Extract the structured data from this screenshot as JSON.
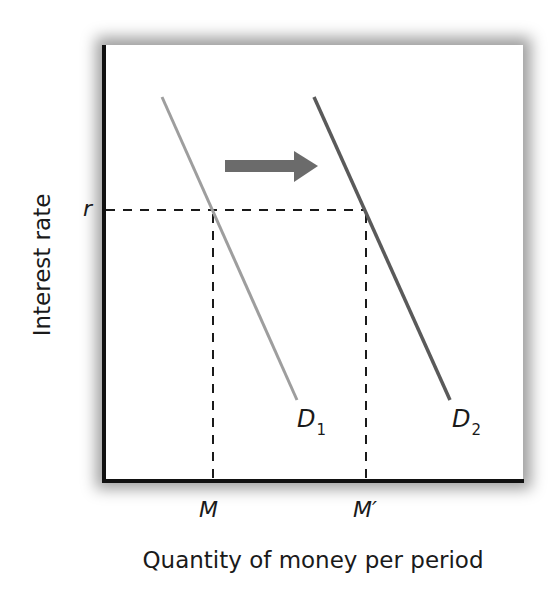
{
  "chart_data": {
    "type": "line",
    "title": "",
    "xlabel": "Quantity of money per period",
    "ylabel": "Interest rate",
    "grid": false,
    "legend": "none",
    "series": [
      {
        "name": "D1",
        "label_main": "D",
        "label_sub": "1",
        "color": "#9e9e9e",
        "points": [
          [
            162,
            97
          ],
          [
            297,
            400
          ]
        ]
      },
      {
        "name": "D2",
        "label_main": "D",
        "label_sub": "2",
        "color": "#5a5a5a",
        "points": [
          [
            314,
            97
          ],
          [
            450,
            400
          ]
        ]
      }
    ],
    "reference_lines": {
      "horizontal": {
        "label": "r",
        "y": 210,
        "x_from": 104,
        "x_to": 366
      },
      "vertical": [
        {
          "label": "M",
          "x": 213,
          "y_from": 210,
          "y_to": 481
        },
        {
          "label": "M′",
          "x": 366,
          "y_from": 210,
          "y_to": 481
        }
      ]
    },
    "annotations": [
      {
        "type": "arrow",
        "direction": "right",
        "meaning": "demand shift right",
        "color": "#6b6b6b"
      }
    ],
    "x_tick_labels": [
      "M",
      "M′"
    ],
    "y_tick_labels": [
      "r"
    ]
  },
  "labels": {
    "ylabel": "Interest rate",
    "xlabel": "Quantity of money per period",
    "r": "r",
    "m": "M",
    "m_prime": "M′",
    "d1_main": "D",
    "d1_sub": "1",
    "d2_main": "D",
    "d2_sub": "2"
  },
  "colors": {
    "axis": "#111111",
    "d1": "#9e9e9e",
    "d2": "#5a5a5a",
    "arrow": "#6b6b6b",
    "dash": "#1a1a1a"
  }
}
